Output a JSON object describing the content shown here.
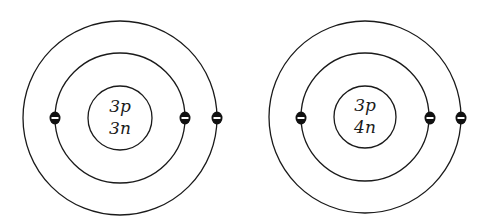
{
  "diagram": {
    "type": "bohr-atom-models",
    "atoms": [
      {
        "id": "atom-left",
        "nucleus": {
          "protons": "3p",
          "neutrons": "3n"
        },
        "center": [
          120,
          118
        ],
        "radii": {
          "nucleus": 32,
          "inner_shell": 65,
          "outer_shell": 97
        },
        "electrons": [
          {
            "shell": "inner",
            "position": "left",
            "symbol": "minus"
          },
          {
            "shell": "inner",
            "position": "right",
            "symbol": "minus"
          },
          {
            "shell": "outer",
            "position": "right",
            "symbol": "minus"
          }
        ]
      },
      {
        "id": "atom-right",
        "nucleus": {
          "protons": "3p",
          "neutrons": "4n"
        },
        "center": [
          368,
          117
        ],
        "radii": {
          "nucleus": 31,
          "inner_shell": 64,
          "outer_shell": 96
        },
        "electrons": [
          {
            "shell": "inner",
            "position": "left",
            "symbol": "minus"
          },
          {
            "shell": "inner",
            "position": "right",
            "symbol": "minus"
          },
          {
            "shell": "outer",
            "position": "right",
            "symbol": "minus"
          }
        ]
      }
    ],
    "colors": {
      "line": "#1a1a1a",
      "electron": "#111111",
      "background": "#ffffff"
    }
  }
}
